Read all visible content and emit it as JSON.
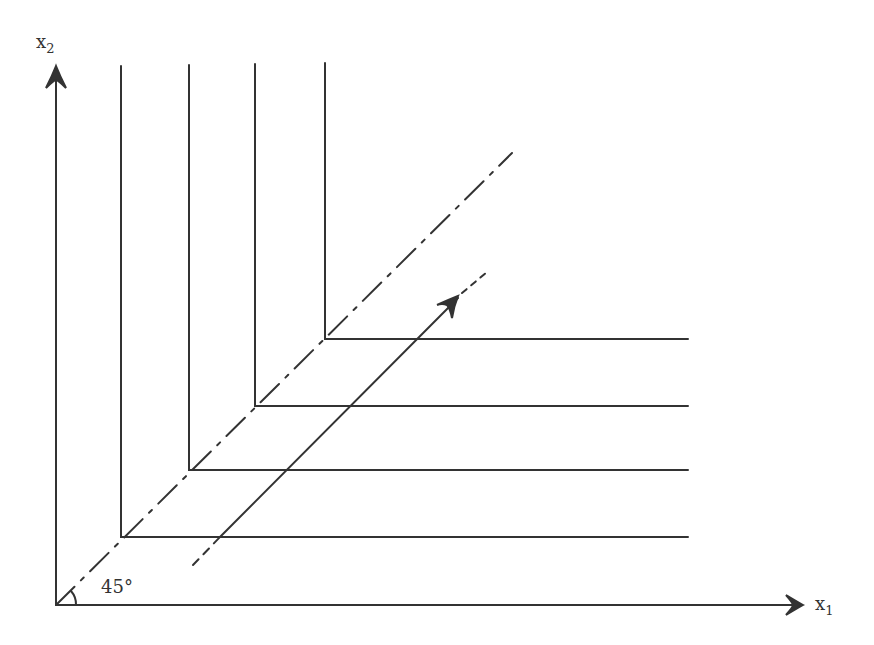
{
  "diagram": {
    "type": "isoquant-map",
    "axes": {
      "x": {
        "label": "x",
        "subscript": "1"
      },
      "y": {
        "label": "x",
        "subscript": "2"
      }
    },
    "angle_label": "45°",
    "isoquants": [
      {
        "corner": [
          121,
          537
        ],
        "top": 66,
        "right": 688
      },
      {
        "corner": [
          189,
          470
        ],
        "top": 65,
        "right": 688
      },
      {
        "corner": [
          255,
          406
        ],
        "top": 64,
        "right": 688
      },
      {
        "corner": [
          325,
          339
        ],
        "top": 63,
        "right": 688
      }
    ],
    "ray_45": {
      "from": [
        56,
        605
      ],
      "to": [
        512,
        153
      ],
      "style": "dash-dot"
    },
    "path_arrow": {
      "solid_from": [
        220,
        537
      ],
      "arrow_at": [
        455,
        300
      ],
      "dashed_to": [
        487,
        272
      ],
      "dashed_start": [
        193,
        565
      ]
    },
    "colors": {
      "ink": "#333333",
      "background": "#ffffff"
    }
  }
}
